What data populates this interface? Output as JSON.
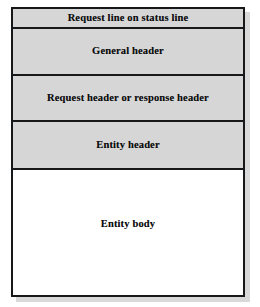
{
  "diagram": {
    "type": "stacked-block-diagram",
    "frame": {
      "border_color": "#16181a",
      "shadow_color": "#b9b9b9"
    },
    "header_fill": "#d6d6d6",
    "body_fill": "#ffffff",
    "rows": [
      {
        "id": "status-line",
        "label": "Request line on status line",
        "fill": "#d6d6d6"
      },
      {
        "id": "general-header",
        "label": "General header",
        "fill": "#d6d6d6"
      },
      {
        "id": "request-response-header",
        "label": "Request header or response header",
        "fill": "#d6d6d6"
      },
      {
        "id": "entity-header",
        "label": "Entity header",
        "fill": "#d6d6d6"
      },
      {
        "id": "entity-body",
        "label": "Entity body",
        "fill": "#ffffff"
      }
    ]
  }
}
